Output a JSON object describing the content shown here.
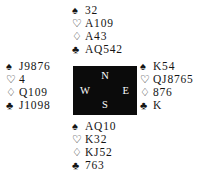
{
  "diagram": {
    "type": "bridge-hand-diagram",
    "suit_symbols": {
      "spade": "♠",
      "heart": "♡",
      "diamond": "♢",
      "club": "♣"
    },
    "compass": {
      "north": "N",
      "west": "W",
      "east": "E",
      "south": "S",
      "background_color": "#0b0b0b",
      "text_color": "#ffffff"
    },
    "hands": {
      "north": {
        "label": "North",
        "spades": "32",
        "hearts": "A109",
        "diamonds": "A43",
        "clubs": "AQ542"
      },
      "west": {
        "label": "West",
        "spades": "J9876",
        "hearts": "4",
        "diamonds": "Q109",
        "clubs": "J1098"
      },
      "east": {
        "label": "East",
        "spades": "K54",
        "hearts": "QJ8765",
        "diamonds": "876",
        "clubs": "K"
      },
      "south": {
        "label": "South",
        "spades": "AQ10",
        "hearts": "K32",
        "diamonds": "KJ52",
        "clubs": "763"
      }
    }
  }
}
